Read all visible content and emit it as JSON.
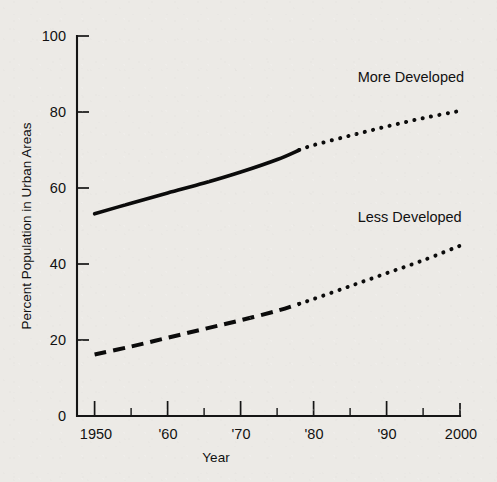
{
  "chart_data": {
    "type": "line",
    "title": "",
    "xlabel": "Year",
    "ylabel": "Percent Population in Urban Areas",
    "xlim": [
      1950,
      2000
    ],
    "ylim": [
      0,
      100
    ],
    "grid": false,
    "legend_position": "inline-annotations",
    "y_ticks": [
      0,
      20,
      40,
      60,
      80,
      100
    ],
    "y_tick_labels": [
      "0",
      "20",
      "40",
      "60",
      "80",
      "100"
    ],
    "x_ticks": [
      1950,
      1955,
      1960,
      1965,
      1970,
      1975,
      1980,
      1985,
      1990,
      1995,
      2000
    ],
    "x_major_ticks": [
      1950,
      1960,
      1970,
      1980,
      1990,
      2000
    ],
    "x_tick_labels": [
      "1950",
      "'60",
      "'70",
      "'80",
      "'90",
      "2000"
    ],
    "x_minor_ticks": [
      1955,
      1965,
      1975,
      1985,
      1995
    ],
    "annotations": [
      {
        "text": "More Developed",
        "x": 1986,
        "y": 88
      },
      {
        "text": "Less Developed",
        "x": 1986,
        "y": 51
      }
    ],
    "series": [
      {
        "name": "More Developed",
        "label": "More Developed",
        "observed_style": "solid",
        "projected_style": "dotted",
        "split_year": 1978,
        "x": [
          1950,
          1955,
          1960,
          1965,
          1970,
          1975,
          1978,
          1980,
          1985,
          1990,
          1995,
          2000
        ],
        "values": [
          53.2,
          56.0,
          58.7,
          61.3,
          64.2,
          67.5,
          70.0,
          71.3,
          73.8,
          76.2,
          78.4,
          80.3
        ]
      },
      {
        "name": "Less Developed",
        "label": "Less Developed",
        "observed_style": "dashed",
        "projected_style": "dotted",
        "split_year": 1978,
        "x": [
          1950,
          1955,
          1960,
          1965,
          1970,
          1975,
          1978,
          1980,
          1985,
          1990,
          1995,
          2000
        ],
        "values": [
          16.2,
          18.3,
          20.6,
          22.9,
          25.2,
          27.7,
          29.5,
          30.8,
          34.2,
          37.6,
          41.0,
          44.8
        ]
      }
    ]
  },
  "axes": {
    "y_label": "Percent Population in Urban Areas",
    "x_label": "Year"
  },
  "colors": {
    "background": "#eceae6",
    "ink": "#0b0b0b",
    "axis": "#151515"
  }
}
